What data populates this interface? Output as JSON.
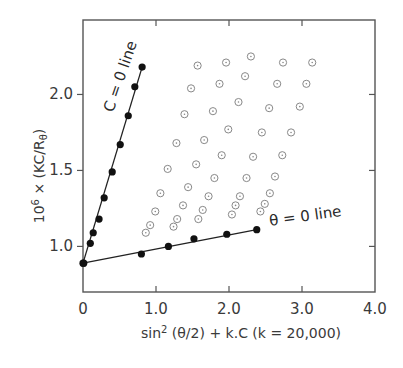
{
  "chart_data": {
    "type": "scatter",
    "title": "",
    "xlabel": "sin² (θ/2) + k.C (k = 20,000)",
    "xlabel_parts": {
      "base": "sin",
      "sup": "2",
      "rest": " (θ/2) + k.C (k = 20,000)"
    },
    "ylabel": "10⁶ × (KC/Rθ)",
    "ylabel_parts": {
      "prefix": "10",
      "sup": "6",
      "mid": " × (KC/R",
      "sub": "θ",
      "suffix": ")"
    },
    "xlim": [
      0,
      4.0
    ],
    "ylim": [
      0.7,
      2.49
    ],
    "xticks": [
      0,
      1.0,
      2.0,
      3.0,
      4.0
    ],
    "xtick_labels": [
      "0",
      "1.0",
      "2.0",
      "3.0",
      "4.0"
    ],
    "yticks": [
      1.0,
      1.5,
      2.0
    ],
    "ytick_labels": [
      "1.0",
      "1.5",
      "2.0"
    ],
    "grid": false,
    "legend": "none",
    "annotations": [
      {
        "text": "C = 0 line",
        "target": "c0_line"
      },
      {
        "text": "θ = 0 line",
        "target": "theta0_line"
      }
    ],
    "series": [
      {
        "name": "C = 0 line",
        "marker": "filled-circle",
        "fit_line": true,
        "points": [
          [
            0.01,
            0.89
          ],
          [
            0.1,
            1.02
          ],
          [
            0.14,
            1.09
          ],
          [
            0.22,
            1.18
          ],
          [
            0.29,
            1.32
          ],
          [
            0.4,
            1.49
          ],
          [
            0.51,
            1.67
          ],
          [
            0.62,
            1.86
          ],
          [
            0.71,
            2.05
          ],
          [
            0.81,
            2.18
          ]
        ],
        "line": [
          [
            0.0,
            0.89
          ],
          [
            0.81,
            2.18
          ]
        ]
      },
      {
        "name": "θ = 0 line",
        "marker": "filled-circle",
        "fit_line": true,
        "points": [
          [
            0.0,
            0.89
          ],
          [
            0.8,
            0.95
          ],
          [
            1.17,
            1.0
          ],
          [
            1.52,
            1.05
          ],
          [
            1.97,
            1.08
          ],
          [
            2.38,
            1.11
          ]
        ],
        "line": [
          [
            0.0,
            0.89
          ],
          [
            2.38,
            1.11
          ]
        ]
      },
      {
        "name": "measured data",
        "marker": "open-dotted-circle",
        "fit_line": false,
        "points": [
          [
            1.57,
            2.19
          ],
          [
            1.96,
            2.21
          ],
          [
            2.3,
            2.25
          ],
          [
            2.74,
            2.21
          ],
          [
            3.14,
            2.21
          ],
          [
            1.48,
            2.04
          ],
          [
            1.87,
            2.07
          ],
          [
            2.22,
            2.12
          ],
          [
            2.66,
            2.07
          ],
          [
            3.06,
            2.07
          ],
          [
            1.39,
            1.87
          ],
          [
            1.78,
            1.89
          ],
          [
            2.13,
            1.95
          ],
          [
            2.55,
            1.91
          ],
          [
            2.97,
            1.92
          ],
          [
            1.28,
            1.68
          ],
          [
            1.66,
            1.7
          ],
          [
            1.99,
            1.77
          ],
          [
            2.45,
            1.75
          ],
          [
            2.85,
            1.75
          ],
          [
            1.16,
            1.51
          ],
          [
            1.55,
            1.54
          ],
          [
            1.9,
            1.6
          ],
          [
            2.33,
            1.59
          ],
          [
            2.73,
            1.6
          ],
          [
            1.06,
            1.35
          ],
          [
            1.44,
            1.39
          ],
          [
            1.8,
            1.45
          ],
          [
            2.24,
            1.45
          ],
          [
            2.63,
            1.46
          ],
          [
            0.99,
            1.23
          ],
          [
            1.37,
            1.27
          ],
          [
            1.72,
            1.33
          ],
          [
            2.15,
            1.33
          ],
          [
            2.56,
            1.35
          ],
          [
            0.92,
            1.14
          ],
          [
            1.29,
            1.18
          ],
          [
            1.64,
            1.24
          ],
          [
            2.09,
            1.27
          ],
          [
            2.49,
            1.28
          ],
          [
            0.86,
            1.09
          ],
          [
            1.24,
            1.13
          ],
          [
            1.58,
            1.18
          ],
          [
            2.04,
            1.21
          ],
          [
            2.43,
            1.23
          ]
        ]
      }
    ],
    "colors": {
      "axis": "#555555",
      "filled": "#111111",
      "open": "#888888",
      "line": "#222222"
    }
  }
}
